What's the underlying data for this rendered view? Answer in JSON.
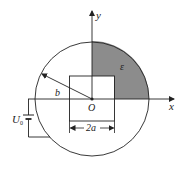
{
  "diagram": {
    "type": "physics-electrostatics",
    "colors": {
      "stroke": "#222222",
      "shade": "#8c8c8c",
      "background": "#ffffff"
    },
    "labels": {
      "y_axis": "y",
      "x_axis": "x",
      "origin": "O",
      "radius": "b",
      "region": "ε",
      "voltage_main": "U",
      "voltage_sub": "0",
      "square_width": "2a"
    },
    "elements": [
      {
        "name": "outer-circle",
        "description": "circle of radius b centered at O"
      },
      {
        "name": "inner-square",
        "description": "square of side 2a centered at O"
      },
      {
        "name": "shaded-region",
        "description": "first-quadrant region between square and circle, filled with dielectric ε"
      },
      {
        "name": "battery",
        "description": "voltage source U0 connected between x-axis conductor and outer circle"
      }
    ]
  }
}
